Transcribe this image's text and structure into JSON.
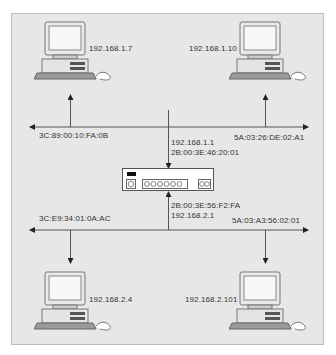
{
  "diagram": {
    "type": "network-topology",
    "background": "#e7e7e7",
    "line_color": "#555555",
    "hosts": [
      {
        "id": "host-1",
        "ip": "192.168.1.7",
        "network": "top"
      },
      {
        "id": "host-2",
        "ip": "192.168.1.10",
        "network": "top"
      },
      {
        "id": "host-3",
        "ip": "192.168.2.4",
        "network": "bottom"
      },
      {
        "id": "host-4",
        "ip": "192.168.2.101",
        "network": "bottom"
      }
    ],
    "top_bus": {
      "left_mac": "3C:89:00:10:FA:0B",
      "right_mac": "5A:03:26:DE:02:A1"
    },
    "bottom_bus": {
      "left_mac": "3C:E9:34:01:0A:AC",
      "right_mac": "5A:03:A3:56:02:01"
    },
    "router": {
      "top_interface": {
        "ip": "192.168.1.1",
        "mac": "2B:00:3E:46:20:01"
      },
      "bottom_interface": {
        "mac": "2B:00:3E:56:F2:FA",
        "ip": "192.168.2.1"
      }
    }
  }
}
